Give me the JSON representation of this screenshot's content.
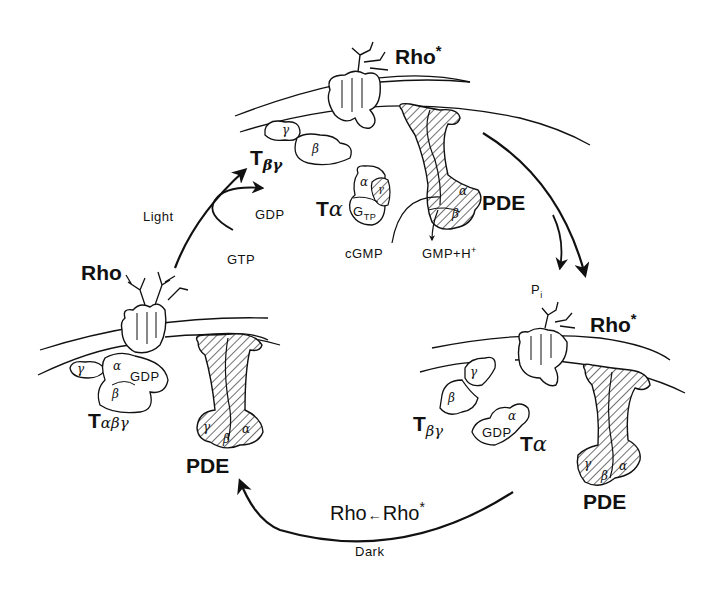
{
  "diagram": {
    "type": "cycle",
    "states": {
      "top": {
        "receptor": "Rho",
        "receptor_mark": "*",
        "transducin_beta_gamma": {
          "base": "T",
          "sub": "βγ",
          "subunits": [
            "γ",
            "β"
          ]
        },
        "transducin_alpha": {
          "base": "T",
          "sub": "α",
          "subunits": [
            "α",
            "γ"
          ],
          "nucleotide": "G",
          "nucleotide_sub": "TP"
        },
        "effector": "PDE",
        "effector_subunits": [
          "α",
          "β"
        ],
        "substrate": "cGMP",
        "product": "GMP+H",
        "product_mark": "+"
      },
      "left": {
        "receptor": "Rho",
        "transducin": {
          "base": "T",
          "sub": "αβγ",
          "subunits": [
            "γ",
            "α",
            "β"
          ],
          "nucleotide": "GDP"
        },
        "effector": "PDE",
        "effector_subunits": [
          "γ",
          "β",
          "α"
        ]
      },
      "right": {
        "receptor": "Rho",
        "receptor_mark": "*",
        "transducin_beta_gamma": {
          "base": "T",
          "sub": "βγ",
          "subunits": [
            "β",
            "γ"
          ]
        },
        "transducin_alpha": {
          "base": "T",
          "sub": "α",
          "subunits": [
            "α"
          ],
          "nucleotide": "GDP"
        },
        "effector": "PDE",
        "effector_subunits": [
          "γ",
          "β",
          "α"
        ]
      }
    },
    "transitions": {
      "activation": {
        "label": "Light",
        "in": "GTP",
        "out": "GDP"
      },
      "hydrolysis": {
        "release": "P",
        "release_sub": "i"
      },
      "reset": {
        "label": "Dark",
        "reaction_from": "Rho",
        "reaction_arrow": "←",
        "reaction_to": "Rho",
        "reaction_to_mark": "*"
      }
    }
  }
}
